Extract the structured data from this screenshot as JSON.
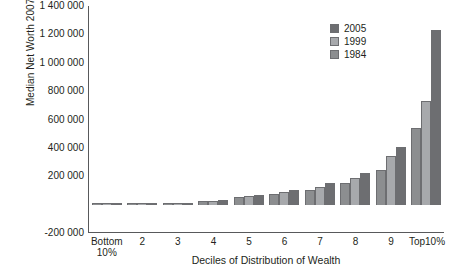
{
  "chart_data": {
    "type": "bar",
    "title": "",
    "xlabel": "Deciles of Distribution of Wealth",
    "ylabel": "Median Net Worth 2007$",
    "categories": [
      "Bottom\n10%",
      "2",
      "3",
      "4",
      "5",
      "6",
      "7",
      "8",
      "9",
      "Top10%"
    ],
    "series": [
      {
        "name": "1984",
        "values": [
          0,
          1000,
          6000,
          25000,
          52000,
          78000,
          105000,
          152000,
          245000,
          540000
        ]
      },
      {
        "name": "1999",
        "values": [
          0,
          1000,
          7000,
          27000,
          60000,
          90000,
          125000,
          190000,
          340000,
          730000
        ]
      },
      {
        "name": "2005",
        "values": [
          0,
          1000,
          8000,
          32000,
          68000,
          105000,
          155000,
          225000,
          405000,
          1230000
        ]
      }
    ],
    "ylim": [
      -200000,
      1400000
    ],
    "ytick_labels": [
      "1 400 000",
      "1 200 000",
      "1 000 000",
      "800 000",
      "600 000",
      "400 000",
      "200 000",
      "-200 000"
    ],
    "ytick_values": [
      1400000,
      1200000,
      1000000,
      800000,
      600000,
      400000,
      200000,
      -200000
    ],
    "grid": false,
    "legend_position": "top-right",
    "legend": [
      "2005",
      "1999",
      "1984"
    ],
    "series_colors": {
      "2005": "#6d6e71",
      "1999": "#a7a9ac",
      "1984": "#8c8e90"
    },
    "bar_order_left_to_right": [
      "1984",
      "1999",
      "2005"
    ]
  }
}
